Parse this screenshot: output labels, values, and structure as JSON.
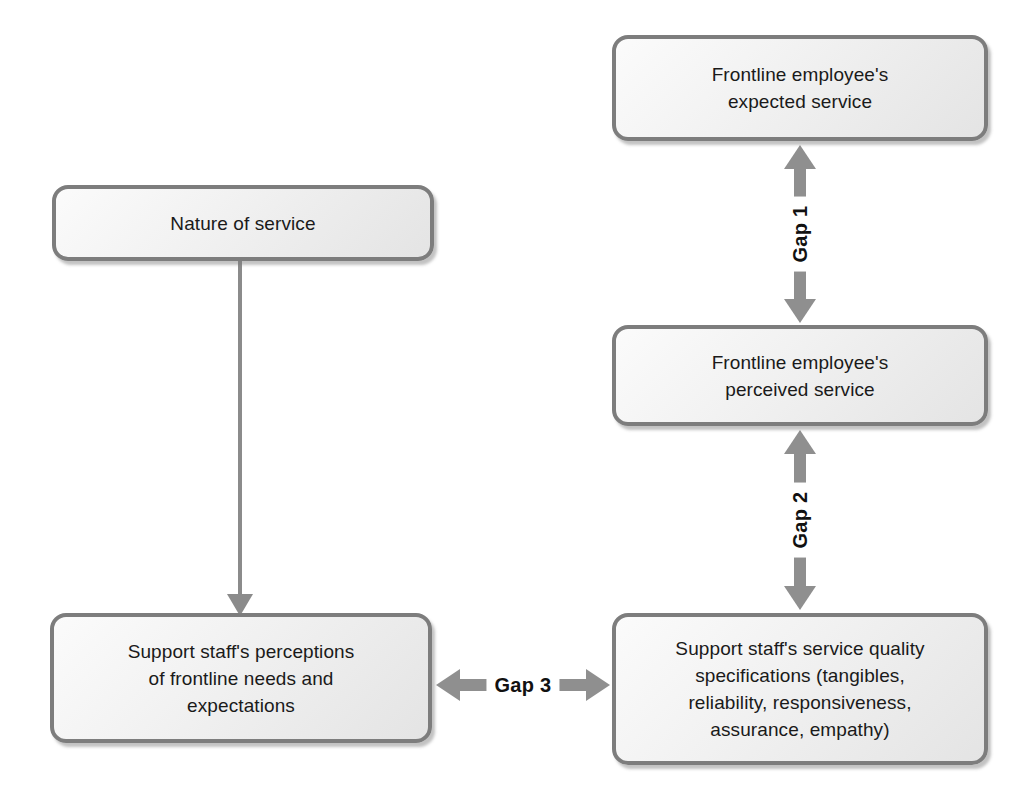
{
  "diagram": {
    "background_color": "#ffffff",
    "node_border_color": "#7d7d7d",
    "node_fill_color": "#f0f0f0",
    "arrow_color": "#8f8f8f",
    "connector_color": "#8b8b8b",
    "label_color": "#111111",
    "nodes": [
      {
        "id": "nature",
        "label": "Nature of service"
      },
      {
        "id": "expected",
        "label": "Frontline employee's\nexpected service"
      },
      {
        "id": "perceived",
        "label": "Frontline employee's\nperceived service"
      },
      {
        "id": "support_perceptions",
        "label": "Support staff's perceptions\nof frontline needs and\nexpectations"
      },
      {
        "id": "support_specifications",
        "label": "Support staff's service quality\nspecifications (tangibles,\nreliability, responsiveness,\nassurance, empathy)"
      }
    ],
    "connectors": [
      {
        "id": "gap1",
        "label": "Gap 1",
        "from": "expected",
        "to": "perceived",
        "orientation": "vertical",
        "style": "double-headed"
      },
      {
        "id": "gap2",
        "label": "Gap 2",
        "from": "perceived",
        "to": "support_specifications",
        "orientation": "vertical",
        "style": "double-headed"
      },
      {
        "id": "gap3",
        "label": "Gap 3",
        "from": "support_perceptions",
        "to": "support_specifications",
        "orientation": "horizontal",
        "style": "double-headed"
      },
      {
        "id": "nature_to_perceptions",
        "label": "",
        "from": "nature",
        "to": "support_perceptions",
        "orientation": "vertical",
        "style": "single-headed"
      }
    ]
  }
}
